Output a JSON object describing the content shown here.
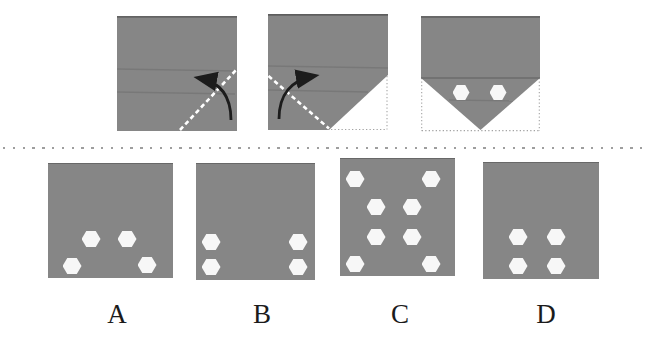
{
  "figure": {
    "type": "paper-folding-hole-punch-puzzle",
    "question_row": "three folding steps with fold lines, arrows and punched holes",
    "answer_row": "four answer squares labeled A to D"
  },
  "colors": {
    "paper_gray": "#868686",
    "hole_white": "#f7f7f7",
    "fold_line_white": "#ffffff",
    "arrow_black": "#1c1c1c",
    "outline_gray": "#a3a3a3",
    "separator_gray": "#8d8d8d",
    "label_black": "#1b1b1b"
  },
  "steps": [
    {
      "name": "step-1",
      "paper": "full square",
      "fold_line": "dashed white line from bottom-center to right-middle",
      "arrow": "curved arrow folding bottom-right corner up-left",
      "holes": []
    },
    {
      "name": "step-2",
      "paper": "square with bottom-right corner folded up (dotted outline of original corner)",
      "fold_line": "dashed white line from left-middle to bottom-center",
      "arrow": "curved arrow folding bottom-left corner up-right",
      "holes": []
    },
    {
      "name": "step-3",
      "paper": "both bottom corners folded, point at bottom center, dotted outline of original square",
      "fold_line": "none",
      "arrow": "none",
      "holes": [
        {
          "x": 40,
          "y": 76.5
        },
        {
          "x": 77,
          "y": 76.5
        }
      ]
    }
  ],
  "options": [
    {
      "label": "A",
      "holes": [
        {
          "x": 43,
          "y": 75
        },
        {
          "x": 79,
          "y": 75
        },
        {
          "x": 24,
          "y": 102
        },
        {
          "x": 99,
          "y": 101
        }
      ]
    },
    {
      "label": "B",
      "holes": [
        {
          "x": 15,
          "y": 78
        },
        {
          "x": 102,
          "y": 78
        },
        {
          "x": 15,
          "y": 103
        },
        {
          "x": 102,
          "y": 103
        }
      ]
    },
    {
      "label": "C",
      "holes": [
        {
          "x": 15,
          "y": 20
        },
        {
          "x": 91,
          "y": 20
        },
        {
          "x": 36,
          "y": 48
        },
        {
          "x": 72,
          "y": 48
        },
        {
          "x": 36,
          "y": 78
        },
        {
          "x": 72,
          "y": 78
        },
        {
          "x": 15,
          "y": 105
        },
        {
          "x": 91,
          "y": 105
        }
      ]
    },
    {
      "label": "D",
      "holes": [
        {
          "x": 35,
          "y": 74
        },
        {
          "x": 73,
          "y": 74
        },
        {
          "x": 35,
          "y": 103
        },
        {
          "x": 73,
          "y": 103
        }
      ]
    }
  ]
}
